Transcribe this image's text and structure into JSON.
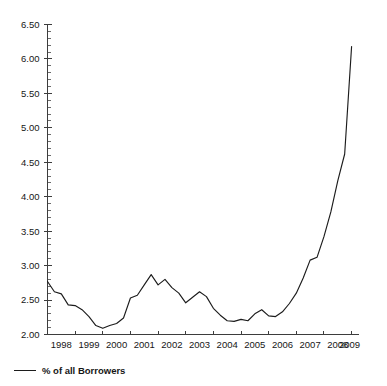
{
  "legend": {
    "position": "bottom-left",
    "entries": [
      {
        "label": "% of all Borrowers",
        "color": "#1c1c1c",
        "marker": "line"
      }
    ]
  },
  "axes": {
    "y_ticks": [
      "2.00",
      "2.50",
      "3.00",
      "3.50",
      "4.00",
      "4.50",
      "5.00",
      "5.50",
      "6.00",
      "6.50"
    ],
    "x_ticks": [
      "1998",
      "1999",
      "2000",
      "2001",
      "2002",
      "2003",
      "2004",
      "2005",
      "2006",
      "2007",
      "2008",
      "2009"
    ]
  },
  "chart_data": {
    "type": "line",
    "title": "",
    "subtitle": "",
    "xlabel": "",
    "ylabel": "",
    "xlim": [
      1997.75,
      2009.0
    ],
    "ylim": [
      2.0,
      6.5
    ],
    "ytick_step": 0.5,
    "yminor_step": 0.1,
    "grid": false,
    "legend_position": "bottom-left",
    "series": [
      {
        "name": "% of all Borrowers",
        "color": "#1c1c1c",
        "x": [
          1997.75,
          1998.0,
          1998.25,
          1998.5,
          1998.75,
          1999.0,
          1999.25,
          1999.5,
          1999.75,
          2000.0,
          2000.25,
          2000.5,
          2000.75,
          2001.0,
          2001.25,
          2001.5,
          2001.75,
          2002.0,
          2002.25,
          2002.5,
          2002.75,
          2003.0,
          2003.25,
          2003.5,
          2003.75,
          2004.0,
          2004.25,
          2004.5,
          2004.75,
          2005.0,
          2005.25,
          2005.5,
          2005.75,
          2006.0,
          2006.25,
          2006.5,
          2006.75,
          2007.0,
          2007.25,
          2007.5,
          2007.75,
          2008.0,
          2008.25,
          2008.5,
          2008.75
        ],
        "values": [
          2.77,
          2.62,
          2.59,
          2.43,
          2.42,
          2.36,
          2.26,
          2.13,
          2.09,
          2.13,
          2.16,
          2.24,
          2.53,
          2.57,
          2.72,
          2.87,
          2.72,
          2.8,
          2.68,
          2.6,
          2.46,
          2.54,
          2.62,
          2.55,
          2.38,
          2.28,
          2.2,
          2.19,
          2.22,
          2.2,
          2.3,
          2.36,
          2.27,
          2.26,
          2.33,
          2.45,
          2.6,
          2.82,
          3.08,
          3.12,
          3.42,
          3.78,
          4.23,
          4.62,
          6.18
        ]
      }
    ]
  }
}
